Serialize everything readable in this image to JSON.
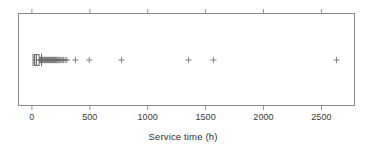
{
  "chart_data": {
    "type": "boxplot",
    "orientation": "horizontal",
    "title": "",
    "xlabel": "Service time (h)",
    "ylabel": "",
    "xlim": [
      -120,
      2790
    ],
    "xticks": [
      0,
      500,
      1000,
      1500,
      2000,
      2500
    ],
    "xticklabels": [
      "0",
      "500",
      "1000",
      "1500",
      "2000",
      "2500"
    ],
    "grid": false,
    "legend": null,
    "frame": "box",
    "boxes": [
      {
        "name": "Service time",
        "whisker_low": 2,
        "q1": 14,
        "median": 30,
        "q3": 55,
        "whisker_high": 75,
        "outlier_marker": "plus",
        "outliers": [
          60,
          66,
          72,
          78,
          84,
          90,
          96,
          101,
          107,
          112,
          118,
          124,
          129,
          134,
          140,
          146,
          151,
          157,
          163,
          168,
          174,
          180,
          186,
          192,
          198,
          204,
          212,
          220,
          228,
          236,
          245,
          255,
          266,
          280,
          296,
          370,
          490,
          770,
          1353,
          1569,
          2638
        ]
      }
    ]
  },
  "axis": {
    "xlabel": "Service time (h)",
    "tick_labels": [
      "0",
      "500",
      "1000",
      "1500",
      "2000",
      "2500"
    ]
  },
  "style": {
    "frame_color": "#8a8a8a",
    "marker_color": "#6e6e6e",
    "box_color": "#555555",
    "box_fill": "#ffffff",
    "text_color": "#2f2f2f",
    "background": "#ffffff"
  }
}
